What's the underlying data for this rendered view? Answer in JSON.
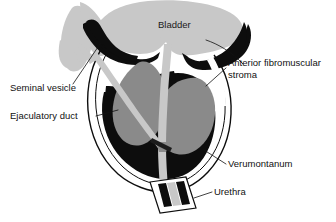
{
  "figure": {
    "background_color": "#ffffff"
  },
  "palette": {
    "black": "#0d0d0d",
    "dark_gray": "#1c1c1c",
    "mid_gray": "#8a8a8a",
    "light_gray": "#c8c8c8",
    "pale_gray": "#bfbfbf",
    "white": "#ffffff",
    "line": "#111111",
    "text": "#111111"
  },
  "labels": {
    "bladder": {
      "text": "Bladder",
      "x": 158,
      "y": 25,
      "anchor": "start",
      "has_leader": false
    },
    "anterior_fibromuscular_stroma": {
      "line1": "Anterior fibromuscular",
      "line2": "stroma",
      "x": 228,
      "y": 67,
      "anchor": "start",
      "has_leader": true
    },
    "seminal_vesicle": {
      "text": "Seminal vesicle",
      "x": 10,
      "y": 88,
      "anchor": "start",
      "has_leader": true
    },
    "ejaculatory_duct": {
      "text": "Ejaculatory duct",
      "x": 10,
      "y": 116,
      "anchor": "start",
      "has_leader": true
    },
    "verumontanum": {
      "text": "Verumontanum",
      "x": 228,
      "y": 164,
      "anchor": "start",
      "has_leader": true
    },
    "urethra": {
      "text": "Urethra",
      "x": 214,
      "y": 192,
      "anchor": "start",
      "has_leader": true
    }
  },
  "structures": {
    "bladder_lumen": "light-gray dome forming the bladder cavity at the top",
    "bladder_muscle_left": "black crescent band along the left inferior bladder wall",
    "bladder_muscle_right": "black crescent band along the right inferior bladder wall",
    "seminal_vesicle_body": "light-gray elongated lobe at the upper left, outside the prostate capsule",
    "prostate_capsule": "thin black outline enclosing the prostate gland",
    "transition_zone_left": "mid-gray lobe on the left side of the prostatic urethra",
    "transition_zone_right": "mid-gray lobe on the right side of the prostatic urethra",
    "peripheral_zone": "large black region filling the posterior and inferior prostate",
    "anterior_fibromuscular_stroma_band": "pale band along the anterior prostate surface",
    "prostatic_urethra": "light-gray channel descending from the bladder neck through the gland",
    "ejaculatory_duct_stripe": "light-gray stripe running obliquely from the seminal vesicle to the verumontanum",
    "verumontanum_point": "convergence of the ejaculatory duct and urethra on the posterior urethral wall",
    "distal_urethra_segment": "boxed distal urethral segment at the apex with two black sphincter bands"
  }
}
